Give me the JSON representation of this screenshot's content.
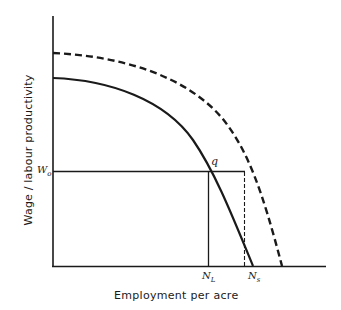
{
  "diagram": {
    "type": "economics-curve-diagram",
    "axes": {
      "y_label": "Wage / labour productivity",
      "x_label": "Employment per acre"
    },
    "curves": [
      {
        "name": "lower-curve",
        "style": "solid",
        "description": "labour productivity curve (lower)"
      },
      {
        "name": "upper-curve",
        "style": "dashed",
        "description": "shifted labour productivity curve (upper)"
      }
    ],
    "points": {
      "wage_level": {
        "symbol": "W",
        "subscript": "o"
      },
      "intersection": {
        "symbol": "q"
      },
      "employment_L": {
        "symbol": "N",
        "subscript": "L"
      },
      "employment_S": {
        "symbol": "N",
        "subscript": "s"
      }
    },
    "colors": {
      "ink": "#1a1a1a",
      "background": "#ffffff"
    }
  }
}
